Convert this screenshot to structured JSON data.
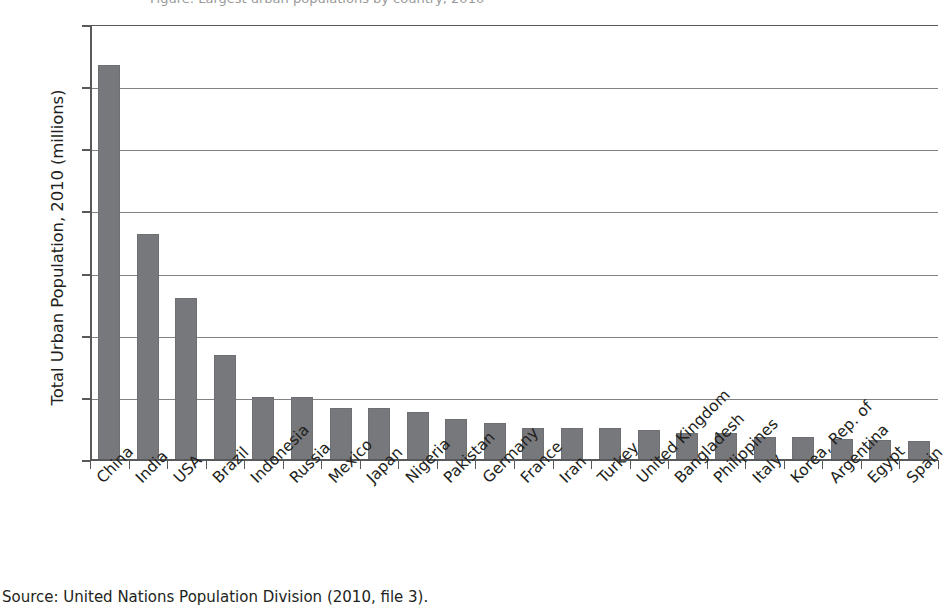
{
  "figure": {
    "clipped_title": "Figure: Largest urban populations by country, 2010",
    "source_note": "Source: United Nations Population Division (2010, file 3)."
  },
  "chart_data": {
    "type": "bar",
    "title": "",
    "xlabel": "",
    "ylabel": "Total Urban Population, 2010 (millions)",
    "ylim": [
      0,
      700
    ],
    "ytick_values": [
      0,
      100,
      200,
      300,
      400,
      500,
      600,
      700
    ],
    "ytick_labels": [
      "0",
      "100",
      "200",
      "300",
      "400",
      "500",
      "600",
      "700"
    ],
    "grid": "horizontal",
    "legend": "none",
    "bar_color": "#76787b",
    "axis_color": "#58595b",
    "gridline_color": "#808285",
    "categories": [
      "China",
      "India",
      "USA",
      "Brazil",
      "Indonesia",
      "Russia",
      "Mexico",
      "Japan",
      "Nigeria",
      "Pakistan",
      "Germany",
      "France",
      "Iran",
      "Turkey",
      "United Kingdom",
      "Bangladesh",
      "Philippines",
      "Italy",
      "Korea, Rep. of",
      "Argentina",
      "Egypt",
      "Spain"
    ],
    "values": [
      636,
      363,
      260,
      169,
      102,
      101,
      84,
      84,
      78,
      66,
      60,
      51,
      51,
      51,
      48,
      44,
      44,
      37,
      37,
      34,
      33,
      31
    ]
  }
}
